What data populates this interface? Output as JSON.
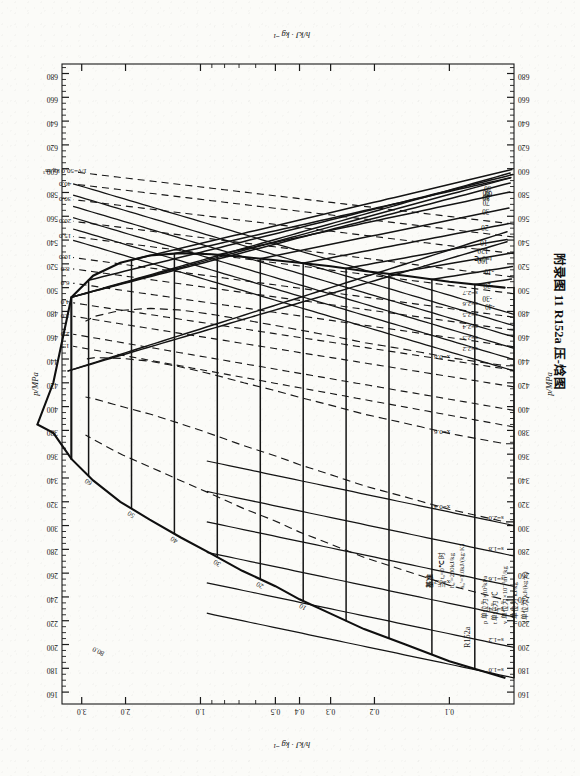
{
  "figure": {
    "caption": "附录图 11  R152a 压-焓图",
    "substance_label": "R152a",
    "enthalpy_axis_label": "h/kJ · kg⁻¹",
    "pressure_axis_label": "p/MPa"
  },
  "reference": {
    "heading": "基准",
    "line1": "当 t₀=0℃ 时",
    "line2": "h₀′=200kJ/kg",
    "line3": "s₀′=1.0kJ/(kg·K)"
  },
  "units": {
    "p": "p 单位为×10²kPa",
    "t": "t 单位为 ℃",
    "v": "v 单位为×10⁻³m³/kg",
    "h": "h 单位为 kJ/kg",
    "s": "s 单位为 kJ/(kg·K)"
  },
  "chart_data": {
    "type": "line",
    "title": "附录图 11  R152a 压-焓图",
    "xlabel": "h/kJ · kg⁻¹",
    "ylabel": "p/MPa",
    "xlim": [
      150,
      688
    ],
    "ylim": [
      0.055,
      3.6
    ],
    "yscale": "log",
    "grid": false,
    "legend": "inline-labels",
    "x_ticks": [
      160,
      180,
      200,
      220,
      240,
      260,
      280,
      300,
      320,
      340,
      360,
      380,
      400,
      420,
      440,
      460,
      480,
      500,
      520,
      540,
      560,
      580,
      600,
      620,
      640,
      660,
      680
    ],
    "x_tick_labels": [
      "160",
      "180",
      "200",
      "220",
      "240",
      "260",
      "280",
      "300",
      "320",
      "340",
      "360",
      "380",
      "400",
      "420",
      "440",
      "460",
      "480",
      "500",
      "520",
      "540",
      "560",
      "580",
      "600",
      "620",
      "640",
      "660",
      "680"
    ],
    "y_ticks": [
      3.0,
      2.0,
      1.0,
      0.5,
      0.4,
      0.3,
      0.2,
      0.1
    ],
    "y_tick_labels": [
      "3.0",
      "2.0",
      "1.0",
      "0.5",
      "0.4",
      "0.3",
      "0.2",
      "0.1"
    ],
    "series": [
      {
        "name": "saturation-dome",
        "kind": "saturation",
        "note": "left branch = saturated liquid, right branch = saturated vapour, joined at critical point",
        "critical_point": {
          "h": 385,
          "p": 4.52
        },
        "liquid_points": [
          [
            172,
            0.06
          ],
          [
            186,
            0.1
          ],
          [
            200,
            0.15
          ],
          [
            213,
            0.22
          ],
          [
            226,
            0.3
          ],
          [
            238,
            0.4
          ],
          [
            249,
            0.5
          ],
          [
            262,
            0.68
          ],
          [
            276,
            0.9
          ],
          [
            290,
            1.2
          ],
          [
            305,
            1.6
          ],
          [
            320,
            2.1
          ],
          [
            338,
            2.7
          ],
          [
            356,
            3.3
          ],
          [
            378,
            3.9
          ]
        ],
        "vapour_points": [
          [
            500,
            0.06
          ],
          [
            505,
            0.1
          ],
          [
            510,
            0.15
          ],
          [
            514,
            0.22
          ],
          [
            518,
            0.3
          ],
          [
            521,
            0.4
          ],
          [
            523,
            0.5
          ],
          [
            526,
            0.68
          ],
          [
            528,
            0.9
          ],
          [
            529,
            1.2
          ],
          [
            527,
            1.6
          ],
          [
            521,
            2.1
          ],
          [
            510,
            2.7
          ],
          [
            492,
            3.3
          ],
          [
            420,
            3.9
          ]
        ]
      },
      {
        "name": "isotherms",
        "kind": "temperature",
        "unit": "℃",
        "label_prefix": "t=",
        "superheat_labels": [
          120,
          100,
          80,
          60,
          40,
          20,
          0,
          -20,
          -30,
          -40
        ],
        "twophase_labels": [
          90,
          80,
          70,
          60,
          50,
          40,
          30,
          20,
          10,
          0,
          -10,
          -20,
          -30,
          -40
        ],
        "marked_zero_label": "t=0℃"
      },
      {
        "name": "isochores-density",
        "kind": "density",
        "unit": "kg/m³",
        "label_prefix": "1/v=",
        "first_label": "1/v=50.0 kg/m³",
        "values": [
          50.0,
          40.0,
          30.0,
          20.0,
          15.0,
          10.0,
          8.0,
          6.0,
          4.0,
          3.0,
          2.0,
          1.5
        ]
      },
      {
        "name": "isentropes",
        "kind": "entropy",
        "unit": "kJ/(kg·K)",
        "label_prefix": "s=",
        "superheat_values": [
          2.7,
          2.6,
          2.5,
          2.4,
          2.3,
          2.2
        ],
        "twophase_values": [
          2.0,
          1.8,
          1.6,
          1.4,
          1.2,
          1.0
        ]
      },
      {
        "name": "quality-lines",
        "kind": "quality",
        "label_prefix": "x=",
        "values": [
          0.8,
          0.6,
          0.4,
          0.2
        ]
      },
      {
        "name": "extra-density-labels",
        "kind": "density",
        "values": [
          80.0
        ]
      }
    ]
  }
}
